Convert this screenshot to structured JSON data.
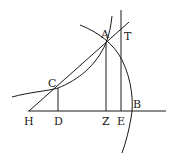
{
  "diagram": {
    "type": "geometric-construction",
    "points": [
      {
        "label": "A",
        "x": 106,
        "y": 43
      },
      {
        "label": "T",
        "x": 121,
        "y": 28
      },
      {
        "label": "C",
        "x": 58,
        "y": 88
      },
      {
        "label": "H",
        "x": 29,
        "y": 111
      },
      {
        "label": "D",
        "x": 58,
        "y": 111
      },
      {
        "label": "Z",
        "x": 106,
        "y": 111
      },
      {
        "label": "E",
        "x": 121,
        "y": 111
      },
      {
        "label": "B",
        "x": 131,
        "y": 111
      }
    ],
    "labels": {
      "A": "A",
      "T": "T",
      "C": "C",
      "H": "H",
      "D": "D",
      "Z": "Z",
      "E": "E",
      "B": "B"
    },
    "lines": [
      {
        "name": "baseline",
        "from": "H",
        "to": "beyond-B"
      },
      {
        "name": "tangent-line-HT",
        "from": "H",
        "to": "T"
      },
      {
        "name": "ordinate-CD",
        "from": "C",
        "to": "D"
      },
      {
        "name": "ordinate-AZ",
        "from": "A",
        "to": "Z"
      },
      {
        "name": "vertical-ET",
        "from": "E",
        "to": "above-T"
      }
    ],
    "curves": [
      {
        "name": "curve-through-C-A"
      },
      {
        "name": "circle-arc-through-A-B"
      }
    ],
    "stroke_color": "#1a1a1a",
    "background": "#ffffff"
  }
}
